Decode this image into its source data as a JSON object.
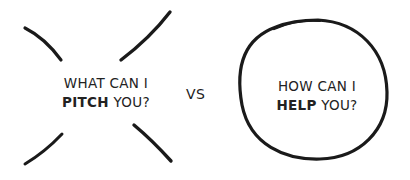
{
  "left": {
    "line1": "WHAT CAN I",
    "bold": "PITCH",
    "rest": " YOU?",
    "decoration": "crossed-out-x-strokes"
  },
  "separator": "VS",
  "right": {
    "line1": "HOW CAN I",
    "bold": "HELP",
    "rest": " YOU?",
    "decoration": "hand-drawn-circle"
  },
  "colors": {
    "ink": "#1a1a1a",
    "background": "#ffffff"
  }
}
